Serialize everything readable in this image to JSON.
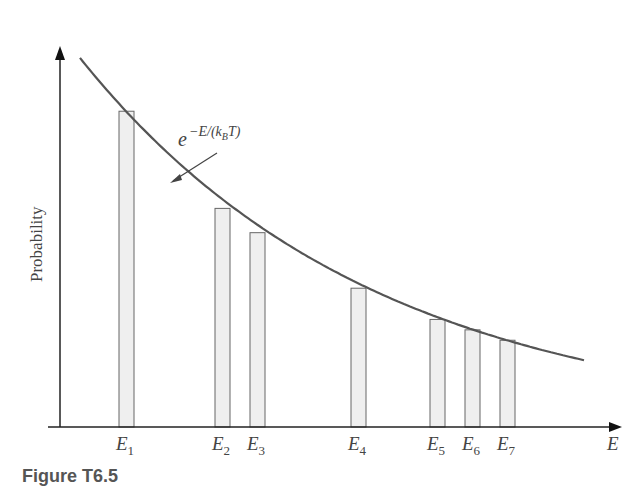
{
  "chart_data": {
    "type": "bar",
    "title": "",
    "xlabel": "E",
    "ylabel": "Probability",
    "categories": [
      "E1",
      "E2",
      "E3",
      "E4",
      "E5",
      "E6",
      "E7"
    ],
    "subscripts": [
      "1",
      "2",
      "3",
      "4",
      "5",
      "6",
      "7"
    ],
    "x_positions_px": [
      126,
      222,
      257,
      358,
      437,
      472,
      507
    ],
    "values": [
      0.91,
      0.63,
      0.56,
      0.4,
      0.31,
      0.28,
      0.25
    ],
    "curve": {
      "label": "e^{-E/(k_B T)}",
      "label_base": "e",
      "label_exponent": "−E/(k",
      "label_sub": "B",
      "label_tail": "T)",
      "type": "exponential decay"
    },
    "ylim": [
      0,
      1
    ],
    "grid": false,
    "legend": "none",
    "colors": {
      "axis": "#222222",
      "curve": "#555555",
      "bar_fill": "#efefef",
      "bar_stroke": "#666666"
    }
  },
  "figure": {
    "caption": "Figure T6.5"
  }
}
